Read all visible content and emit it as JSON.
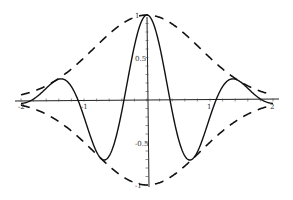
{
  "chart_data": {
    "type": "line",
    "title": "",
    "xlabel": "",
    "ylabel": "",
    "xlim": [
      -2,
      2
    ],
    "ylim": [
      -1,
      1
    ],
    "grid": false,
    "legend": null,
    "x_ticks": [
      -2,
      -1,
      1,
      2
    ],
    "x_tick_labels": [
      "-2",
      "-1",
      "1",
      "2"
    ],
    "y_ticks": [
      1,
      0.5,
      -0.5,
      -1
    ],
    "y_tick_labels": [
      "1",
      "0.5",
      "-0.5",
      "-1"
    ],
    "series": [
      {
        "name": "wavelet",
        "style": "solid",
        "description": "Gaussian-modulated cosine, f(x) = exp(-0.7 x^2) cos(4.3 x)",
        "x": [
          -2,
          -1.75,
          -1.45,
          -1.2,
          -1,
          -0.73,
          -0.37,
          0,
          0.37,
          0.73,
          1,
          1.2,
          1.45,
          1.75,
          2
        ],
        "y": [
          0.0,
          0.05,
          0.2,
          0.1,
          -0.2,
          -0.72,
          0.0,
          1.0,
          0.0,
          -0.72,
          -0.2,
          0.1,
          0.2,
          0.05,
          0.0
        ]
      },
      {
        "name": "upper envelope",
        "style": "dashed",
        "description": "exp(-0.7 x^2)",
        "x": [
          -2,
          -1.5,
          -1,
          -0.5,
          0,
          0.5,
          1,
          1.5,
          2
        ],
        "y": [
          0.06,
          0.21,
          0.5,
          0.84,
          1.0,
          0.84,
          0.5,
          0.21,
          0.06
        ]
      },
      {
        "name": "lower envelope",
        "style": "dashed",
        "description": "-exp(-0.7 x^2)",
        "x": [
          -2,
          -1.5,
          -1,
          -0.5,
          0,
          0.5,
          1,
          1.5,
          2
        ],
        "y": [
          -0.06,
          -0.21,
          -0.5,
          -0.84,
          -1.0,
          -0.84,
          -0.5,
          -0.21,
          -0.06
        ]
      }
    ],
    "params": {
      "envelope_a": 0.7,
      "frequency_k": 4.3
    }
  },
  "layout": {
    "origin_px": [
      147,
      100
    ],
    "px_per_x": 63,
    "px_per_y": 85
  }
}
